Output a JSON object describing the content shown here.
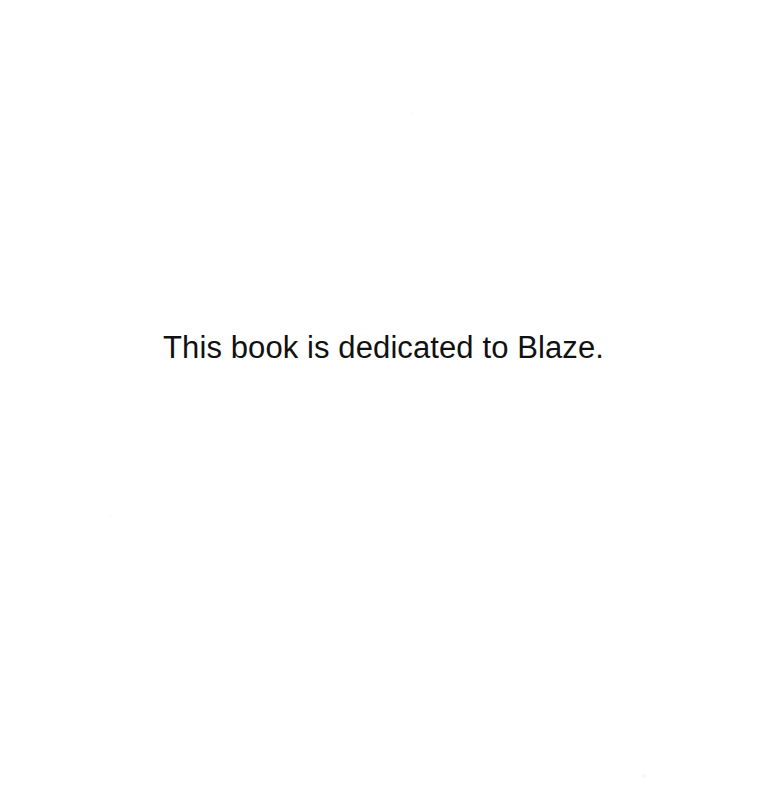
{
  "page": {
    "background_color": "#ffffff",
    "width": 767,
    "height": 788
  },
  "dedication": {
    "text": "This book is dedicated to Blaze.",
    "text_color": "#111111",
    "alignment": "center"
  },
  "artifacts": {
    "speck_color": "#cfcfd4"
  }
}
